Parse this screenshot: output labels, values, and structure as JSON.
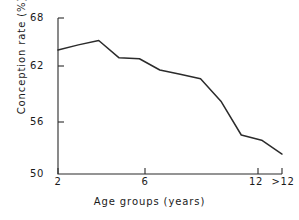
{
  "chart_data": {
    "type": "line",
    "title": "",
    "xlabel": "Age groups (years)",
    "ylabel": "Conception rate (%)",
    "x": [
      2,
      3,
      4,
      5,
      6,
      7,
      8,
      9,
      10,
      11,
      12,
      13
    ],
    "x_tick_values": [
      2,
      6,
      12,
      13
    ],
    "x_tick_labels": [
      "2",
      "6",
      "12",
      ">12"
    ],
    "y_tick_labels": [
      "68",
      "62",
      "56",
      "50"
    ],
    "y_tick_values": [
      68,
      62,
      56,
      50
    ],
    "ylim": [
      50,
      68
    ],
    "xlim": [
      2,
      13
    ],
    "grid": false,
    "legend": false,
    "series": [
      {
        "name": "Conception rate",
        "color": "#2b2b2b",
        "values": [
          64.3,
          64.9,
          65.4,
          63.4,
          63.3,
          62.0,
          61.5,
          61.0,
          58.4,
          54.5,
          53.9,
          52.3
        ]
      }
    ]
  },
  "axis": {
    "y_title": "Conception rate (%)",
    "x_title": "Age groups (years)"
  }
}
